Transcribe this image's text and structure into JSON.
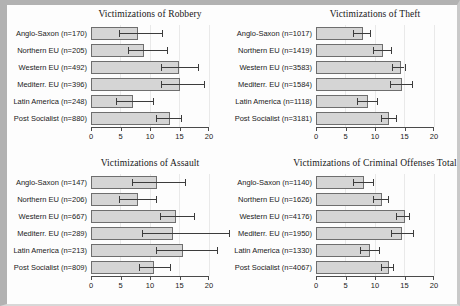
{
  "figure": {
    "regions_order": [
      "Anglo-Saxon",
      "Northern EU",
      "Western EU",
      "Mediterr. EU",
      "Latin America",
      "Post Socialist"
    ]
  },
  "colors": {
    "bar_fill": "#d5d5d5",
    "bar_border": "#6e6e6e",
    "error_bar": "#3c3c3c",
    "axis": "#4a4a4a",
    "gridline": "#e9e9e9",
    "frame": "#b2b2b2",
    "background": "#fdfdfd"
  },
  "chart_data": [
    {
      "type": "bar",
      "orientation": "horizontal",
      "title": "Victimizations of Robbery",
      "categories": [
        "Anglo-Saxon (n=170)",
        "Northern EU (n=205)",
        "Western EU (n=492)",
        "Mediterr. EU (n=396)",
        "Latin America (n=248)",
        "Post Socialist (n=880)"
      ],
      "values": [
        7.7,
        8.7,
        14.6,
        14.7,
        6.8,
        13.1
      ],
      "ci_low": [
        4.8,
        6.2,
        11.9,
        11.8,
        4.3,
        11.1
      ],
      "ci_high": [
        12.1,
        12.9,
        18.1,
        19.2,
        10.5,
        15.2
      ],
      "xlim": [
        0,
        20
      ],
      "xticks": [
        0,
        5,
        10,
        15,
        20
      ],
      "grid": true,
      "legend": null
    },
    {
      "type": "bar",
      "orientation": "horizontal",
      "title": "Victimizations of Theft",
      "categories": [
        "Anglo-Saxon (n=1017)",
        "Northern EU (n=1419)",
        "Western EU (n=3583)",
        "Mediterr. EU (n=1584)",
        "Latin America (n=1118)",
        "Post Socialist (n=3181)"
      ],
      "values": [
        7.7,
        11.0,
        14.0,
        14.3,
        8.5,
        12.1
      ],
      "ci_low": [
        6.3,
        9.7,
        12.9,
        12.5,
        6.9,
        11.0
      ],
      "ci_high": [
        9.1,
        12.7,
        15.0,
        16.2,
        10.4,
        13.5
      ],
      "xlim": [
        0,
        20
      ],
      "xticks": [
        0,
        5,
        10,
        15,
        20
      ],
      "grid": true,
      "legend": null
    },
    {
      "type": "bar",
      "orientation": "horizontal",
      "title": "Victimizations of Assault",
      "categories": [
        "Anglo-Saxon (n=147)",
        "Northern EU (n=206)",
        "Western EU (n=667)",
        "Mediterr. EU (n=289)",
        "Latin America (n=213)",
        "Post Socialist (n=809)"
      ],
      "values": [
        10.8,
        7.6,
        14.0,
        13.6,
        15.3,
        10.4
      ],
      "ci_low": [
        7.0,
        4.8,
        11.7,
        8.6,
        11.1,
        8.2
      ],
      "ci_high": [
        16.0,
        11.0,
        17.4,
        23.4,
        21.3,
        13.4
      ],
      "xlim": [
        0,
        20
      ],
      "xticks": [
        0,
        5,
        10,
        15,
        20
      ],
      "grid": true,
      "legend": null
    },
    {
      "type": "bar",
      "orientation": "horizontal",
      "title": "Victimizations of Criminal Offenses Total",
      "categories": [
        "Anglo-Saxon (n=1140)",
        "Northern EU (n=1626)",
        "Western EU (n=4176)",
        "Mediterr. EU (n=1950)",
        "Latin America (n=1330)",
        "Post Socialist (n=4067)"
      ],
      "values": [
        7.8,
        10.8,
        14.8,
        14.3,
        8.8,
        12.0
      ],
      "ci_low": [
        6.2,
        9.6,
        13.5,
        12.7,
        7.4,
        11.1
      ],
      "ci_high": [
        9.6,
        12.2,
        15.8,
        16.4,
        10.7,
        13.1
      ],
      "xlim": [
        0,
        20
      ],
      "xticks": [
        0,
        5,
        10,
        15,
        20
      ],
      "grid": true,
      "legend": null
    }
  ]
}
